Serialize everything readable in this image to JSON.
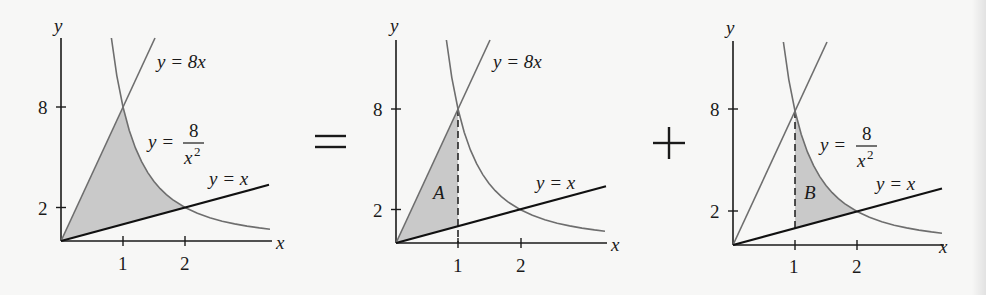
{
  "figure": {
    "equation_symbols": {
      "equals": "=",
      "plus": "+"
    },
    "colors": {
      "background": "#f7f7f6",
      "shade": "#c9c9c9",
      "axis": "#1a1a1a",
      "line_yx": "#111111",
      "curve_gray": "#6e6e6e"
    },
    "panels": [
      {
        "id": "total",
        "region_label": "",
        "shaded": "between y=8x and y=x bounded by y=8/x^2",
        "axis_labels": {
          "x": "x",
          "y": "y"
        },
        "x_ticks": [
          "1",
          "2"
        ],
        "y_ticks": [
          "8",
          "2"
        ],
        "curve_labels": {
          "line_8x": "y = 8x",
          "hyperbola_lhs": "y =",
          "hyperbola_num": "8",
          "hyperbola_den": "x",
          "hyperbola_exp": "2",
          "line_x": "y = x"
        }
      },
      {
        "id": "region-A",
        "region_label": "A",
        "shaded": "between y=8x and y=x for 0 ≤ x ≤ 1",
        "axis_labels": {
          "x": "x",
          "y": "y"
        },
        "x_ticks": [
          "1",
          "2"
        ],
        "y_ticks": [
          "8",
          "2"
        ],
        "curve_labels": {
          "line_8x": "y = 8x",
          "line_x": "y = x"
        }
      },
      {
        "id": "region-B",
        "region_label": "B",
        "shaded": "between y=8/x^2 and y=x for 1 ≤ x ≤ 2",
        "axis_labels": {
          "x": "x",
          "y": "y"
        },
        "x_ticks": [
          "1",
          "2"
        ],
        "y_ticks": [
          "8",
          "2"
        ],
        "curve_labels": {
          "hyperbola_lhs": "y =",
          "hyperbola_num": "8",
          "hyperbola_den": "x",
          "hyperbola_exp": "2",
          "line_x": "y = x"
        }
      }
    ]
  }
}
